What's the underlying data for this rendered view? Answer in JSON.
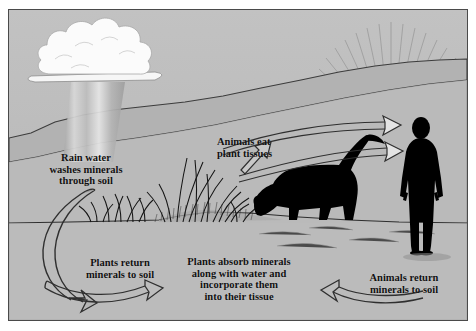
{
  "diagram": {
    "background_color": "#b9b9b9",
    "border_color": "#4a4a4a",
    "labels": [
      {
        "id": "rain",
        "text": "Rain water washes minerals through soil",
        "lines": [
          "Rain water",
          "washes minerals",
          "through soil"
        ],
        "align": "center"
      },
      {
        "id": "animals_eat",
        "text": "Animals eat plant tissues",
        "lines": [
          "Animals eat",
          "plant tissues"
        ],
        "align": "left"
      },
      {
        "id": "plants_return",
        "text": "Plants return minerals to soil",
        "lines": [
          "Plants return",
          "minerals to soil"
        ],
        "align": "center"
      },
      {
        "id": "plants_absorb",
        "text": "Plants absorb minerals along with water and incorporate them into their tissue",
        "lines": [
          "Plants absorb minerals",
          "along with water and",
          "incorporate them",
          "into their tissue"
        ],
        "align": "center"
      },
      {
        "id": "animals_return",
        "text": "Animals return minerals to soil",
        "lines": [
          "Animals return",
          "minerals to soil"
        ],
        "align": "center"
      }
    ],
    "elements": [
      {
        "id": "cloud",
        "name": "rain-cloud",
        "color": "#f7f7f7"
      },
      {
        "id": "rain_shaft",
        "name": "rain-shaft",
        "color": "#c9c9c9"
      },
      {
        "id": "sun",
        "name": "sun-with-rays",
        "color": "#ededed"
      },
      {
        "id": "hills",
        "name": "rolling-hills",
        "color": "#b0b0b0"
      },
      {
        "id": "grass",
        "name": "grass-clump",
        "color": "#1a1a1a"
      },
      {
        "id": "cow",
        "name": "cow-silhouette",
        "color": "#000000"
      },
      {
        "id": "human",
        "name": "human-silhouette",
        "color": "#000000"
      },
      {
        "id": "ground",
        "name": "ground-line",
        "color": "#3a3a3a"
      }
    ],
    "arrows": [
      {
        "id": "arrow_rain_down",
        "name": "arrow-rain-into-soil",
        "direction": "down-left-curve"
      },
      {
        "id": "arrow_soil_to_plants",
        "name": "arrow-soil-to-plants",
        "direction": "right"
      },
      {
        "id": "arrow_plants_to_cow",
        "name": "arrow-plants-to-cow",
        "direction": "up-right"
      },
      {
        "id": "arrow_cow_to_human_upper",
        "name": "arrow-animals-to-human-upper",
        "direction": "right"
      },
      {
        "id": "arrow_cow_to_human_lower",
        "name": "arrow-animals-to-human-lower",
        "direction": "right"
      },
      {
        "id": "arrow_human_to_soil",
        "name": "arrow-animals-return-to-soil",
        "direction": "left"
      }
    ]
  }
}
